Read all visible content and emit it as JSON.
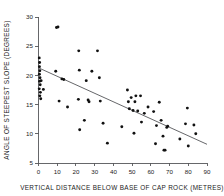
{
  "chart_data": {
    "type": "scatter",
    "title": "",
    "xlabel": "VERTICAL  DISTANCE  BELOW  BASE  OF  CAP  ROCK  (METRES)",
    "ylabel": "ANGLE OF STEEPEST SLOPE (DEGREES)",
    "xlim": [
      0,
      90
    ],
    "ylim": [
      5,
      30
    ],
    "xticks": [
      0,
      10,
      20,
      30,
      40,
      50,
      60,
      70,
      80,
      90
    ],
    "yticks": [
      5,
      10,
      15,
      20,
      25,
      30
    ],
    "xtick_labels": [
      "0",
      "10",
      "20",
      "30",
      "40",
      "50",
      "60",
      "70",
      "80",
      "90"
    ],
    "ytick_labels": [
      "5",
      "10",
      "15",
      "20",
      "25",
      "30"
    ],
    "grid": false,
    "legend": false,
    "marker": "filled-circle",
    "marker_color": "#111111",
    "axis_color": "#55565a",
    "points": [
      [
        0.4,
        23.0
      ],
      [
        0.6,
        22.2
      ],
      [
        0.5,
        21.5
      ],
      [
        0.7,
        20.8
      ],
      [
        0.5,
        20.2
      ],
      [
        0.8,
        19.6
      ],
      [
        0.6,
        19.0
      ],
      [
        0.9,
        18.4
      ],
      [
        0.4,
        17.7
      ],
      [
        1.0,
        17.1
      ],
      [
        0.7,
        16.5
      ],
      [
        1.2,
        16.0
      ],
      [
        1.4,
        19.1
      ],
      [
        2.6,
        17.6
      ],
      [
        9.6,
        28.2
      ],
      [
        10.4,
        28.3
      ],
      [
        9.2,
        20.7
      ],
      [
        12.5,
        19.4
      ],
      [
        13.5,
        19.3
      ],
      [
        11.0,
        15.6
      ],
      [
        15.5,
        14.6
      ],
      [
        21.5,
        24.2
      ],
      [
        21.8,
        20.9
      ],
      [
        21.3,
        15.9
      ],
      [
        22.0,
        10.7
      ],
      [
        24.5,
        12.3
      ],
      [
        25.5,
        19.1
      ],
      [
        26.5,
        15.8
      ],
      [
        27.0,
        15.5
      ],
      [
        28.5,
        20.7
      ],
      [
        31.5,
        24.2
      ],
      [
        32.5,
        19.6
      ],
      [
        33.0,
        15.6
      ],
      [
        34.5,
        11.8
      ],
      [
        36.8,
        8.4
      ],
      [
        44.5,
        11.2
      ],
      [
        47.5,
        17.5
      ],
      [
        48.0,
        15.5
      ],
      [
        48.5,
        14.3
      ],
      [
        49.5,
        16.2
      ],
      [
        50.5,
        14.0
      ],
      [
        51.0,
        10.1
      ],
      [
        51.5,
        15.5
      ],
      [
        52.0,
        16.5
      ],
      [
        54.5,
        16.5
      ],
      [
        53.0,
        13.9
      ],
      [
        55.0,
        12.0
      ],
      [
        56.5,
        13.5
      ],
      [
        58.5,
        14.6
      ],
      [
        61.5,
        13.8
      ],
      [
        62.5,
        8.3
      ],
      [
        63.0,
        11.4
      ],
      [
        64.5,
        15.4
      ],
      [
        65.5,
        12.3
      ],
      [
        66.5,
        9.6
      ],
      [
        67.0,
        7.2
      ],
      [
        67.6,
        7.2
      ],
      [
        68.5,
        11.1
      ],
      [
        69.0,
        11.3
      ],
      [
        75.5,
        9.1
      ],
      [
        78.5,
        11.7
      ],
      [
        79.5,
        14.4
      ],
      [
        80.0,
        7.9
      ],
      [
        83.0,
        11.5
      ],
      [
        84.0,
        10.0
      ]
    ],
    "fit_line": {
      "label": "regression line",
      "x": [
        0,
        90
      ],
      "y": [
        21.3,
        8.2
      ]
    }
  }
}
